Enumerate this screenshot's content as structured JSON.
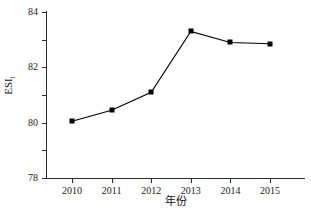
{
  "chart_data": {
    "type": "line",
    "title": "",
    "xlabel": "年份",
    "ylabel": "ESI",
    "ylabel_sub": "j",
    "categories": [
      "2010",
      "2011",
      "2012",
      "2013",
      "2014",
      "2015"
    ],
    "x": [
      2010,
      2011,
      2012,
      2013,
      2014,
      2015
    ],
    "values": [
      76.1,
      76.9,
      78.2,
      82.6,
      81.8,
      81.7
    ],
    "series": [
      {
        "name": "ESIj",
        "values": [
          76.1,
          76.9,
          78.2,
          82.6,
          81.8,
          81.7
        ]
      }
    ],
    "ylim": [
      72,
      84
    ],
    "yticks": [
      72,
      74,
      76,
      78,
      80,
      82,
      84
    ],
    "ytick_labels": [
      "72",
      "74",
      "76",
      "78",
      "80",
      "82",
      "84"
    ],
    "xtick_labels": [
      "2010",
      "2011",
      "2012",
      "2013",
      "2014",
      "2015"
    ],
    "grid": false,
    "legend": false,
    "legend_position": "none",
    "marker": "square",
    "line_color": "#000000",
    "marker_color": "#000000",
    "axis_color": "#2b2b2b",
    "background_color": "#ffffff"
  }
}
